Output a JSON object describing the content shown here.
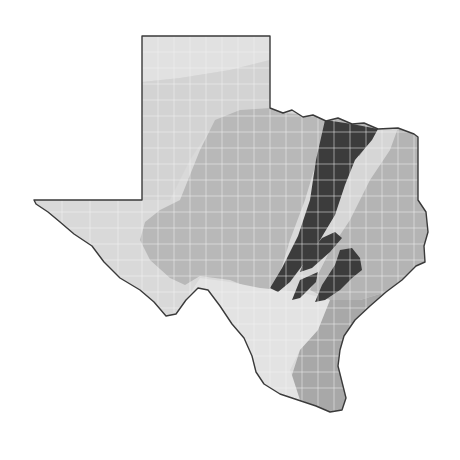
{
  "map": {
    "subject": "Texas",
    "style": "grayscale regional shading with county boundaries",
    "colors": {
      "background": "#ffffff",
      "outline": "#3a3a3a",
      "region_light": "#d9d9d9",
      "region_lighter": "#e3e3e3",
      "region_medium": "#b8b8b8",
      "region_medium_dark": "#a6a6a6",
      "region_dark": "#3c3c3c",
      "county_lines": "#f2f2f2"
    },
    "regions": [
      {
        "name": "trans-pecos-west",
        "shade": "region_light"
      },
      {
        "name": "panhandle-high-plains",
        "shade": "region_light"
      },
      {
        "name": "rolling-plains",
        "shade": "region_medium"
      },
      {
        "name": "central-hill-country",
        "shade": "region_medium"
      },
      {
        "name": "blackland-prairie",
        "shade": "region_dark"
      },
      {
        "name": "east-texas-piney-woods",
        "shade": "region_medium"
      },
      {
        "name": "south-texas-plains",
        "shade": "region_lighter"
      },
      {
        "name": "gulf-coast",
        "shade": "region_medium_dark"
      }
    ]
  }
}
